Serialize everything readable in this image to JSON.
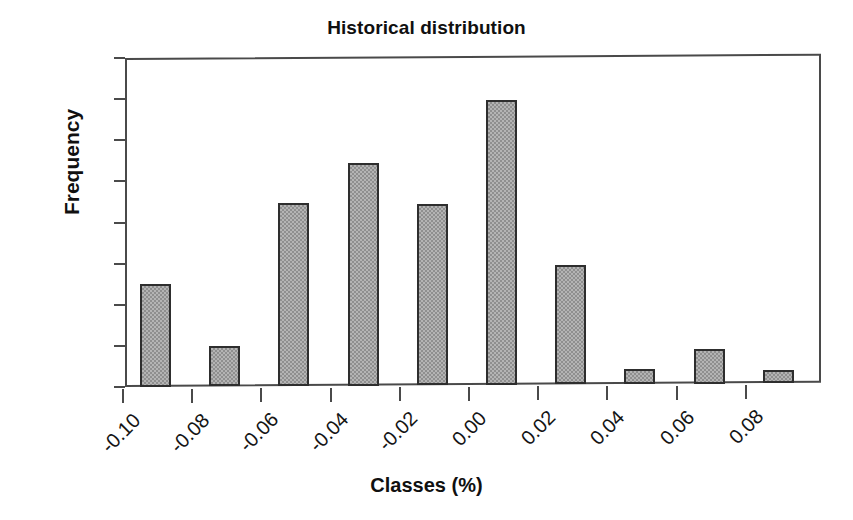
{
  "chart_data": {
    "type": "bar",
    "title": "Historical distribution",
    "xlabel": "Classes (%)",
    "ylabel": "Frequency",
    "categories": [
      "-0.10",
      "-0.08",
      "-0.06",
      "-0.04",
      "-0.02",
      "0.00",
      "0.02",
      "0.04",
      "0.06",
      "0.08"
    ],
    "values": [
      5.0,
      1.95,
      8.9,
      10.85,
      8.8,
      13.85,
      5.8,
      0.75,
      1.7,
      0.65
    ],
    "ylim": [
      0,
      16
    ],
    "ytick_labels": [
      "0",
      "2",
      "4",
      "6",
      "8",
      "10",
      "12",
      "14",
      "16"
    ],
    "ytick_values": [
      0,
      2,
      4,
      6,
      8,
      10,
      12,
      14,
      16
    ],
    "grid": false,
    "legend": null,
    "bar_fill_color": "#9d9d9d",
    "bar_edge_color": "#2e2e2e",
    "axis_color": "#4a4a4a",
    "text_color": "#101010",
    "background_color": "#ffffff",
    "xtick_label_rotation": -45
  }
}
